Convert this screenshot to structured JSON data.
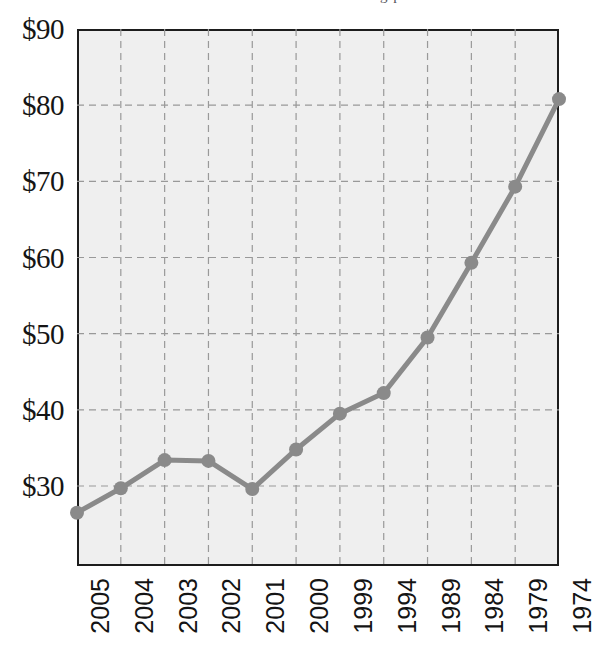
{
  "page": {
    "top_fragment_text": "g p"
  },
  "chart_data": {
    "type": "line",
    "title": "",
    "subtitle": "",
    "xlabel": "",
    "ylabel": "",
    "categories": [
      "2005",
      "2004",
      "2003",
      "2002",
      "2001",
      "2000",
      "1999",
      "1994",
      "1989",
      "1984",
      "1979",
      "1974"
    ],
    "values": [
      26.5,
      29.7,
      33.4,
      33.3,
      29.6,
      34.8,
      39.5,
      42.2,
      49.5,
      59.3,
      69.3,
      80.8
    ],
    "series": [
      {
        "name": "value",
        "values": [
          26.5,
          29.7,
          33.4,
          33.3,
          29.6,
          34.8,
          39.5,
          42.2,
          49.5,
          59.3,
          69.3,
          80.8
        ]
      }
    ],
    "points": [
      {
        "x": "2005",
        "y": 26.5
      },
      {
        "x": "2004",
        "y": 29.7
      },
      {
        "x": "2003",
        "y": 33.4
      },
      {
        "x": "2002",
        "y": 33.3
      },
      {
        "x": "2001",
        "y": 29.6
      },
      {
        "x": "2000",
        "y": 34.8
      },
      {
        "x": "1999",
        "y": 39.5
      },
      {
        "x": "1994",
        "y": 42.2
      },
      {
        "x": "1989",
        "y": 49.5
      },
      {
        "x": "1984",
        "y": 59.3
      },
      {
        "x": "1979",
        "y": 69.3
      },
      {
        "x": "1974",
        "y": 80.8
      }
    ],
    "ytick_labels": [
      "$90",
      "$80",
      "$70",
      "$60",
      "$50",
      "$40",
      "$30"
    ],
    "ytick_values": [
      90,
      80,
      70,
      60,
      50,
      40,
      30
    ],
    "xtick_labels": [
      "2005",
      "2004",
      "2003",
      "2002",
      "2001",
      "2000",
      "1999",
      "1994",
      "1989",
      "1984",
      "1979",
      "1974"
    ],
    "ylim": [
      19.5,
      90
    ],
    "xlim": [
      0,
      11
    ],
    "grid": true,
    "grid_style": "dashed",
    "legend": false,
    "legend_position": "none",
    "annotations": [],
    "colors": {
      "line": "#8a8a8a",
      "marker": "#8a8a8a",
      "plot_background": "#efefef",
      "page_background": "#ffffff",
      "axis_border": "#1d1d1d",
      "gridline": "#999999",
      "tick_label": "#141414"
    },
    "value_prefix": "$"
  }
}
